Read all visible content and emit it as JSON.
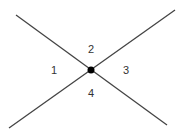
{
  "diagram": {
    "colors": {
      "line": "#444444",
      "dot": "#000000",
      "background": "#ffffff"
    },
    "lines": [
      {
        "id": "line-a",
        "x1": 16,
        "y1": 15,
        "x2": 167,
        "y2": 125
      },
      {
        "id": "line-b",
        "x1": 9,
        "y1": 128,
        "x2": 175,
        "y2": 10
      }
    ],
    "intersection": {
      "x": 91,
      "y": 70,
      "r": 3.5
    },
    "regions": [
      {
        "label": "1",
        "x": 54,
        "y": 70
      },
      {
        "label": "2",
        "x": 91,
        "y": 49
      },
      {
        "label": "3",
        "x": 126,
        "y": 70
      },
      {
        "label": "4",
        "x": 91,
        "y": 93
      }
    ]
  }
}
